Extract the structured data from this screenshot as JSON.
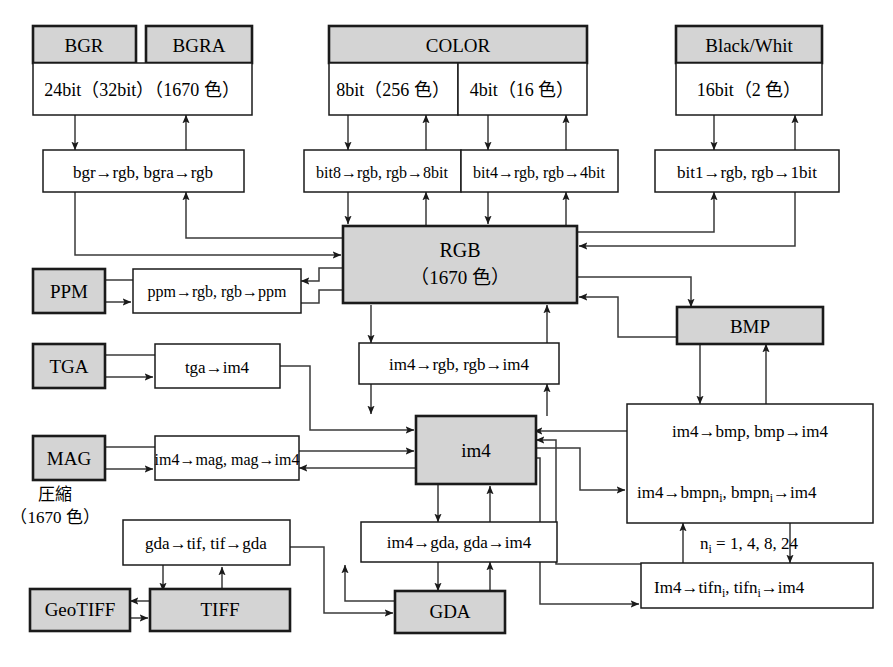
{
  "diagram": {
    "colors": {
      "shaded": "#d4d4d4",
      "plain": "#ffffff",
      "stroke": "#1a1a1a",
      "text": "#000000"
    },
    "format_boxes": {
      "bgr": "BGR",
      "bgra": "BGRA",
      "color": "COLOR",
      "blackwhite": "Black/Whit",
      "ppm": "PPM",
      "tga": "TGA",
      "mag": "MAG",
      "bmp": "BMP",
      "geotiff": "GeoTIFF",
      "tiff": "TIFF",
      "gda": "GDA"
    },
    "depth_boxes": {
      "bgr_depth": "24bit（32bit）（1670 色）",
      "color_8bit": "8bit（256 色）",
      "color_4bit": "4bit（16 色）",
      "bw_depth": "16bit（2 色）"
    },
    "core_boxes": {
      "rgb_line1": "RGB",
      "rgb_line2": "（1670 色）",
      "im4": "im4"
    },
    "function_boxes": {
      "bgr_fn": "bgr→rgb,  bgra→rgb",
      "bit8_fn": "bit8→rgb, rgb→8bit",
      "bit4_fn": "bit4→rgb, rgb→4bit",
      "bit1_fn": "bit1→rgb,  rgb→1bit",
      "ppm_fn": "ppm→rgb, rgb→ppm",
      "im4rgb_fn": "im4→rgb,  rgb→im4",
      "tga_fn": "tga→im4",
      "mag_fn": "im4→mag, mag→im4",
      "gda_fn": "im4→gda,  gda→im4",
      "tif_fn": "gda→tif,  tif→gda",
      "bmp_fn_line1": "im4→bmp,  bmp→im4",
      "bmp_fn_line2_a": "im4→bmpn",
      "bmp_fn_line2_sub1": "i",
      "bmp_fn_line2_b": ",  bmpn",
      "bmp_fn_line2_sub2": "i",
      "bmp_fn_line2_c": "→im4",
      "tifn_fn_a": "Im4→tifn",
      "tifn_fn_sub1": "i",
      "tifn_fn_b": ",  tifn",
      "tifn_fn_sub2": "i",
      "tifn_fn_c": "→im4"
    },
    "annotations": {
      "compression_label_line1": "圧縮",
      "compression_label_line2": "（1670 色）",
      "ni_values_a": "n",
      "ni_values_sub": "i",
      "ni_values_b": " = 1, 4, 8, 24"
    }
  }
}
